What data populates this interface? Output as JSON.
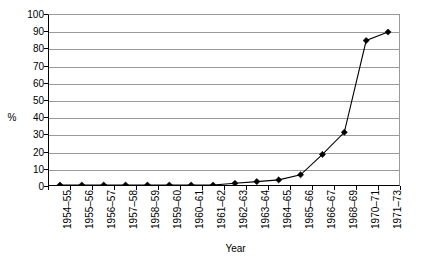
{
  "chart_data": {
    "type": "line",
    "title": "",
    "xlabel": "Year",
    "ylabel": "%",
    "ylim": [
      0,
      100
    ],
    "ytick_step": 10,
    "grid": true,
    "legend": false,
    "marker": "diamond",
    "line_color": "#000000",
    "marker_color": "#000000",
    "grid_color": "#9a9a9a",
    "axis_color": "#000000",
    "background_color": "#ffffff",
    "categories": [
      "1954–55",
      "1955–56",
      "1956–57",
      "1957–58",
      "1958–59",
      "1959–60",
      "1960–61",
      "1961–62",
      "1962–63",
      "1963–64",
      "1964–65",
      "1965–66",
      "1966–67",
      "1968–69",
      "1970–71",
      "1971–73"
    ],
    "values": [
      0,
      0,
      0,
      0,
      0,
      0,
      0,
      0,
      1,
      2,
      3,
      6,
      18,
      31,
      85,
      90
    ],
    "ytick_labels": [
      "0",
      "10",
      "20",
      "30",
      "40",
      "50",
      "60",
      "70",
      "80",
      "90",
      "100"
    ]
  },
  "axes": {
    "y_title": "%",
    "x_title": "Year"
  }
}
